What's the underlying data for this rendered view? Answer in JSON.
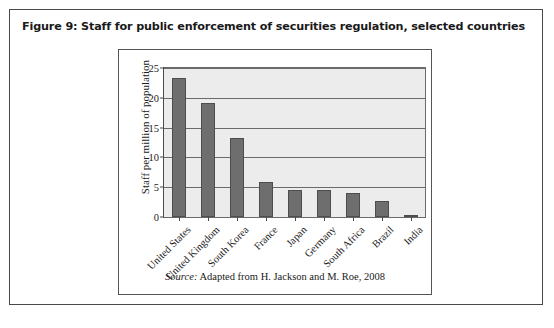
{
  "figure": {
    "title": "Figure 9: Staff for public enforcement of securities regulation, selected countries",
    "source_prefix": "Source:",
    "source_text": " Adapted from H. Jackson and M. Roe, 2008"
  },
  "colors": {
    "frame_border": "#4a4a4a",
    "chart_border": "#555555",
    "plot_background": "#ececec",
    "bar_fill": "#6e6e6e",
    "bar_stroke": "#4d4d4d",
    "gridline": "#6a6a6a",
    "text": "#1a1a1a",
    "page_background": "#ffffff"
  },
  "chart_data": {
    "type": "bar",
    "title": "Staff for public enforcement of securities regulation, selected countries",
    "xlabel": "",
    "ylabel": "Staff per million of population",
    "categories": [
      "United States",
      "United Kingdom",
      "South Korea",
      "France",
      "Japan",
      "Germany",
      "South Africa",
      "Brazil",
      "India"
    ],
    "values": [
      23.4,
      19.2,
      13.2,
      5.9,
      4.6,
      4.6,
      4.0,
      2.7,
      0.4
    ],
    "ylim": [
      0,
      25
    ],
    "yticks": [
      0,
      5,
      10,
      15,
      20,
      25
    ],
    "ytick_labels": [
      "0",
      "5",
      "10",
      "15",
      "20",
      "25"
    ],
    "grid": true,
    "legend": "none",
    "xlabel_rotation": -45
  }
}
